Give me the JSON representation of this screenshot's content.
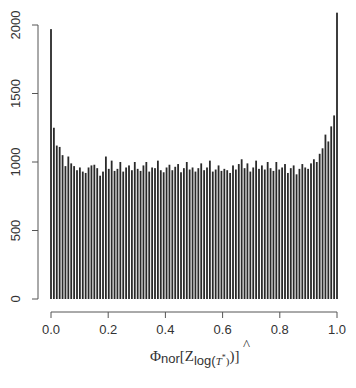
{
  "chart_data": {
    "type": "bar",
    "subtype": "histogram",
    "title": "",
    "xlabel": "Φnor[Zlog(T̂*)]",
    "ylabel": "",
    "xlim": [
      0,
      1
    ],
    "ylim": [
      0,
      2000
    ],
    "x_ticks": [
      "0.0",
      "0.2",
      "0.4",
      "0.6",
      "0.8",
      "1.0"
    ],
    "y_ticks": [
      "0",
      "500",
      "1000",
      "1500",
      "2000"
    ],
    "grid": false,
    "legend": null,
    "bin_width": 0.01,
    "bins": 100,
    "values": [
      1970,
      1250,
      1120,
      1110,
      1050,
      970,
      1040,
      990,
      970,
      940,
      960,
      930,
      920,
      960,
      975,
      980,
      955,
      900,
      930,
      1040,
      950,
      1010,
      935,
      950,
      1000,
      930,
      960,
      975,
      940,
      1000,
      950,
      935,
      975,
      1000,
      930,
      960,
      955,
      1010,
      940,
      925,
      960,
      980,
      940,
      965,
      985,
      925,
      955,
      1000,
      945,
      960,
      930,
      955,
      990,
      940,
      960,
      1010,
      930,
      945,
      975,
      935,
      950,
      940,
      920,
      975,
      945,
      985,
      1020,
      955,
      990,
      930,
      960,
      1010,
      950,
      975,
      945,
      1000,
      955,
      935,
      1000,
      945,
      960,
      985,
      920,
      955,
      975,
      910,
      950,
      985,
      960,
      950,
      990,
      1020,
      1000,
      1060,
      1100,
      1200,
      1150,
      1260,
      1340,
      2090
    ]
  },
  "axes": {
    "x_tick_labels": [
      "0.0",
      "0.2",
      "0.4",
      "0.6",
      "0.8",
      "1.0"
    ],
    "y_tick_labels": [
      "0",
      "500",
      "1000",
      "1500",
      "2000"
    ],
    "xlabel_main": "Φ",
    "xlabel_sub1": "nor",
    "xlabel_bracket_open": "[Z",
    "xlabel_sub2": "log(",
    "xlabel_T": "T",
    "xlabel_hat": "^",
    "xlabel_star": "*",
    "xlabel_close_sub": ")",
    "xlabel_bracket_close": ")]"
  },
  "colors": {
    "bar": "#2a2a2a",
    "axis": "#444444",
    "text": "#333333",
    "background": "#ffffff"
  }
}
